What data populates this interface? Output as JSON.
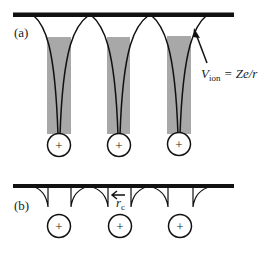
{
  "figure": {
    "panel_a": {
      "label": "(a)",
      "potential_label_main": "V",
      "potential_label_sub": "ion",
      "potential_label_rest": " = Ze/r",
      "ions": [
        "+",
        "+",
        "+"
      ]
    },
    "panel_b": {
      "label": "(b)",
      "cutoff_label_main": "r",
      "cutoff_label_sub": "c",
      "ions": [
        "+",
        "+",
        "+"
      ]
    },
    "colors": {
      "line": "#111111",
      "shade": "#a8a8a8"
    }
  }
}
